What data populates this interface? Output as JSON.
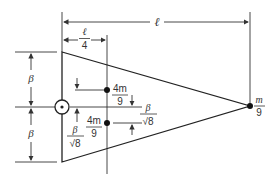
{
  "diagram": {
    "type": "mechanics-figure",
    "colors": {
      "line": "#333333",
      "background": "#ffffff"
    },
    "dimensions": {
      "total_length": {
        "label": "ℓ"
      },
      "quarter_length": {
        "num": "ℓ",
        "den": "4"
      },
      "upper_half_height": {
        "label": "β"
      },
      "lower_half_height": {
        "label": "β"
      },
      "offset_upper": {
        "num": "β",
        "den": "√8"
      },
      "offset_lower": {
        "num": "β",
        "den": "√8"
      }
    },
    "masses": [
      {
        "name": "upper-mass",
        "num": "4m",
        "den": "9"
      },
      {
        "name": "lower-mass",
        "num": "4m",
        "den": "9"
      },
      {
        "name": "apex-mass",
        "num": "m",
        "den": "9"
      }
    ],
    "pivot": {
      "symbol": "⊙"
    }
  }
}
